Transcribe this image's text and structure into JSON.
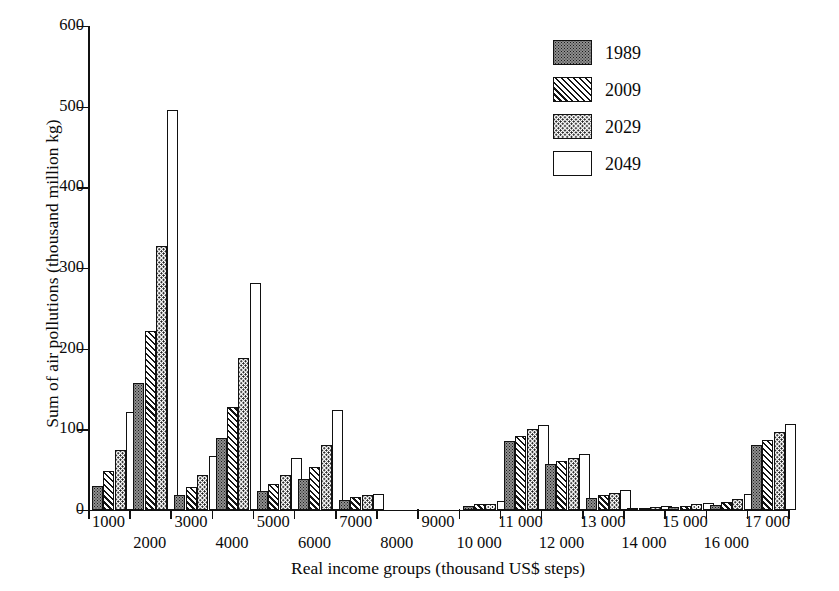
{
  "chart_data": {
    "type": "bar",
    "title": "",
    "xlabel": "Real income groups (thousand US$ steps)",
    "ylabel": "Sum of air pollutions (thousand million kg)",
    "ylim": [
      0,
      600
    ],
    "ytick_labels": [
      "0",
      "100",
      "200",
      "300",
      "400",
      "500",
      "600"
    ],
    "ytick_values": [
      0,
      100,
      200,
      300,
      400,
      500,
      600
    ],
    "grid": false,
    "legend_position": "top-right",
    "categories": [
      "1000",
      "2000",
      "3000",
      "4000",
      "5000",
      "6000",
      "7000",
      "8000",
      "9000",
      "10 000",
      "11 000",
      "12 000",
      "13 000",
      "14 000",
      "15 000",
      "16 000",
      "17 000"
    ],
    "series": [
      {
        "name": "1989",
        "pattern": "dense-stipple",
        "values": [
          30,
          157,
          19,
          89,
          23,
          38,
          13,
          0,
          0,
          5,
          85,
          57,
          15,
          2,
          4,
          6,
          80
        ]
      },
      {
        "name": "2009",
        "pattern": "diagonal-hatch",
        "values": [
          48,
          222,
          28,
          128,
          32,
          53,
          16,
          0,
          0,
          7,
          92,
          61,
          18,
          3,
          5,
          10,
          87
        ]
      },
      {
        "name": "2029",
        "pattern": "sparse-dots",
        "values": [
          75,
          327,
          43,
          188,
          43,
          80,
          19,
          0,
          0,
          8,
          100,
          65,
          21,
          4,
          7,
          14,
          97
        ]
      },
      {
        "name": "2049",
        "pattern": "empty",
        "values": [
          122,
          496,
          67,
          282,
          64,
          124,
          20,
          0,
          0,
          11,
          105,
          69,
          25,
          5,
          9,
          20,
          107
        ]
      }
    ]
  },
  "legend": {
    "items": [
      {
        "label": "1989"
      },
      {
        "label": "2009"
      },
      {
        "label": "2029"
      },
      {
        "label": "2049"
      }
    ]
  }
}
